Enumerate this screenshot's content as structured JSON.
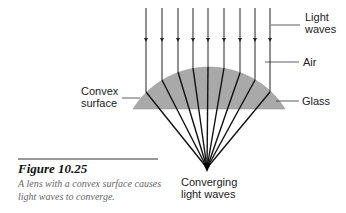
{
  "labels": {
    "light_waves": "Light\nwaves",
    "air": "Air",
    "glass": "Glass",
    "convex_surface": "Convex\nsurface",
    "converging": "Converging\nlight waves"
  },
  "figure": {
    "title": "Figure 10.25",
    "caption": "A lens with a convex surface causes light waves to converge."
  },
  "colors": {
    "lens_fill": "#a9a9a9",
    "ray": "#111111",
    "caption": "#666666"
  }
}
